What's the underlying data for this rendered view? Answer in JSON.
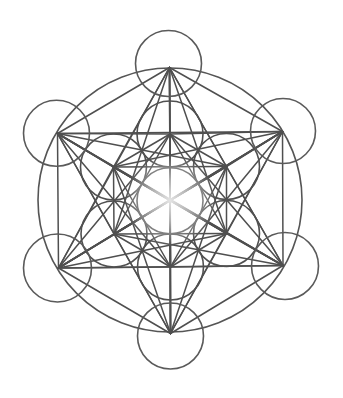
{
  "figure": {
    "title": "Metatron's Cube",
    "canvas": {
      "width": 343,
      "height": 398,
      "background": "#ffffff"
    },
    "stroke_color": "#505050",
    "center_glow_color": "#ffffff",
    "center": {
      "x": 170,
      "y": 200.5
    },
    "circle_radius": 33,
    "big_circle": {
      "cx": 170,
      "cy": 200,
      "r": 132
    },
    "nodes": [
      {
        "name": "center",
        "x": 170,
        "y": 200.5
      },
      {
        "name": "inner-top",
        "x": 170,
        "y": 134
      },
      {
        "name": "inner-upper-right",
        "x": 226.5,
        "y": 166.5
      },
      {
        "name": "inner-lower-right",
        "x": 226.5,
        "y": 233.5
      },
      {
        "name": "inner-bottom",
        "x": 170.5,
        "y": 267
      },
      {
        "name": "inner-lower-left",
        "x": 114,
        "y": 234
      },
      {
        "name": "inner-upper-left",
        "x": 113.5,
        "y": 167
      },
      {
        "name": "outer-top",
        "x": 169.5,
        "y": 67.5
      },
      {
        "name": "outer-upper-right",
        "x": 282.5,
        "y": 131.5
      },
      {
        "name": "outer-lower-right",
        "x": 283,
        "y": 265.5
      },
      {
        "name": "outer-bottom",
        "x": 170.5,
        "y": 333.5
      },
      {
        "name": "outer-lower-left",
        "x": 58.5,
        "y": 268
      },
      {
        "name": "outer-upper-left",
        "x": 57.5,
        "y": 133.5
      }
    ],
    "circles": [
      {
        "name": "center",
        "cx": 170,
        "cy": 200.8,
        "r": 33,
        "kind": "inner"
      },
      {
        "name": "inner-top",
        "cx": 170,
        "cy": 134,
        "r": 33,
        "kind": "inner"
      },
      {
        "name": "inner-upper-right",
        "cx": 226.5,
        "cy": 166.5,
        "r": 33,
        "kind": "inner"
      },
      {
        "name": "inner-lower-right",
        "cx": 226.5,
        "cy": 233.5,
        "r": 33,
        "kind": "inner"
      },
      {
        "name": "inner-bottom",
        "cx": 170.5,
        "cy": 267,
        "r": 33,
        "kind": "inner"
      },
      {
        "name": "inner-lower-left",
        "cx": 114,
        "cy": 234,
        "r": 33,
        "kind": "inner"
      },
      {
        "name": "inner-upper-left",
        "cx": 113.5,
        "cy": 167,
        "r": 33,
        "kind": "inner"
      },
      {
        "name": "outer-top",
        "cx": 168.5,
        "cy": 63.5,
        "r": 33,
        "kind": "outer"
      },
      {
        "name": "outer-upper-right",
        "cx": 283,
        "cy": 131,
        "r": 32.5,
        "kind": "outer"
      },
      {
        "name": "outer-lower-right",
        "cx": 285,
        "cy": 266,
        "r": 33.5,
        "kind": "outer"
      },
      {
        "name": "outer-bottom",
        "cx": 170.5,
        "cy": 336,
        "r": 33,
        "kind": "outer"
      },
      {
        "name": "outer-lower-left",
        "cx": 57.5,
        "cy": 268,
        "r": 34,
        "kind": "outer"
      },
      {
        "name": "outer-upper-left",
        "cx": 56.5,
        "cy": 133.3,
        "r": 33,
        "kind": "outer"
      }
    ],
    "connect_all_nodes": true,
    "line_count": 78
  }
}
